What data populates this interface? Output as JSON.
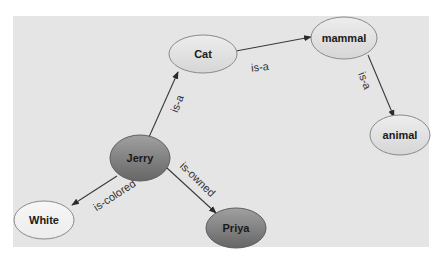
{
  "diagram": {
    "type": "semantic-network",
    "canvas": {
      "width": 443,
      "height": 263,
      "background": "#ffffff"
    },
    "panel": {
      "x": 13,
      "y": 16,
      "width": 416,
      "height": 231,
      "fill": "#e5e5e5"
    },
    "nodes": [
      {
        "id": "cat",
        "label": "Cat",
        "cx": 203,
        "cy": 54,
        "rx": 34,
        "ry": 19,
        "style": "light"
      },
      {
        "id": "mammal",
        "label": "mammal",
        "cx": 344,
        "cy": 38,
        "rx": 33,
        "ry": 21,
        "style": "light"
      },
      {
        "id": "animal",
        "label": "animal",
        "cx": 400,
        "cy": 135,
        "rx": 30,
        "ry": 20,
        "style": "light"
      },
      {
        "id": "jerry",
        "label": "Jerry",
        "cx": 140,
        "cy": 158,
        "rx": 30,
        "ry": 23,
        "style": "dark"
      },
      {
        "id": "white",
        "label": "White",
        "cx": 44,
        "cy": 220,
        "rx": 30,
        "ry": 19,
        "style": "white"
      },
      {
        "id": "priya",
        "label": "Priya",
        "cx": 236,
        "cy": 228,
        "rx": 30,
        "ry": 20,
        "style": "dark"
      }
    ],
    "edges": [
      {
        "from": "jerry",
        "to": "cat",
        "label": "is-a",
        "x1": 149,
        "y1": 137,
        "x2": 178,
        "y2": 72,
        "lx": 178,
        "ly": 104,
        "angle": -69
      },
      {
        "from": "cat",
        "to": "mammal",
        "label": "is-a",
        "x1": 236,
        "y1": 51,
        "x2": 311,
        "y2": 37,
        "lx": 260,
        "ly": 68,
        "angle": -6
      },
      {
        "from": "mammal",
        "to": "animal",
        "label": "is-a",
        "x1": 368,
        "y1": 55,
        "x2": 394,
        "y2": 117,
        "lx": 364,
        "ly": 81,
        "angle": 68
      },
      {
        "from": "jerry",
        "to": "white",
        "label": "is-colored",
        "x1": 117,
        "y1": 176,
        "x2": 72,
        "y2": 205,
        "lx": 115,
        "ly": 196,
        "angle": -33
      },
      {
        "from": "jerry",
        "to": "priya",
        "label": "is-owned",
        "x1": 167,
        "y1": 168,
        "x2": 216,
        "y2": 213,
        "lx": 197,
        "ly": 180,
        "angle": 44
      }
    ],
    "colors": {
      "light_top": "#ededed",
      "light_bottom": "#d6d6d6",
      "dark_top": "#9c9c9c",
      "dark_bottom": "#6a6a6a",
      "white_fill": "#f3f3f3",
      "stroke": "#8a8a8a",
      "edge": "#3a3a3a"
    }
  }
}
